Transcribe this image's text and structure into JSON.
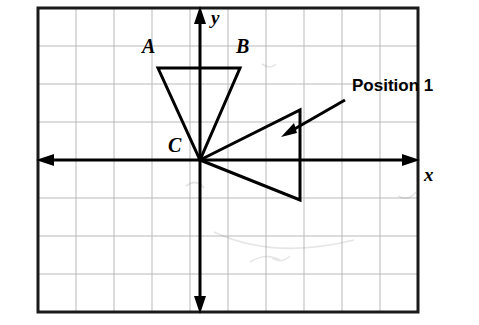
{
  "figure": {
    "title_visible": false,
    "axis_labels": {
      "x": "x",
      "y": "y"
    },
    "vertex_labels": {
      "a": "A",
      "b": "B",
      "c": "C"
    },
    "annotation": {
      "text": "Position 1",
      "arrow": true
    },
    "colors": {
      "grid": "#b9b9b9",
      "border": "#1a1a1a",
      "axis": "#000000",
      "shape": "#000000",
      "text": "#000000",
      "background": "#ffffff"
    },
    "grid": {
      "visible": true,
      "columns": 10,
      "rows": 8,
      "cell_size": 38,
      "origin_cell": {
        "x": 4,
        "y": 4
      }
    },
    "shapes": [
      {
        "name": "triangle-abc",
        "points": [
          {
            "label": "A",
            "x": -1.4,
            "y": 2.2
          },
          {
            "label": "B",
            "x": 1.2,
            "y": 2.2
          },
          {
            "label": "C",
            "x": 0,
            "y": 0
          }
        ]
      },
      {
        "name": "triangle-position-1",
        "points": [
          {
            "label": "",
            "x": 0,
            "y": 0
          },
          {
            "label": "",
            "x": 2.2,
            "y": 1.3
          },
          {
            "label": "",
            "x": 2.2,
            "y": -1.3
          }
        ]
      }
    ]
  }
}
